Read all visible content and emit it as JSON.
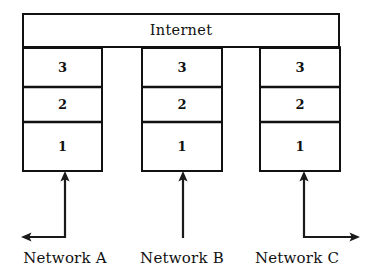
{
  "figure": {
    "type": "diagram",
    "background_color": "#ffffff",
    "line_color": "#111111"
  },
  "internet": {
    "label": "Internet",
    "box": {
      "x": 22,
      "y": 13,
      "width": 318,
      "height": 34
    }
  },
  "layers": [
    {
      "label": "3",
      "y": 47,
      "height": 40
    },
    {
      "label": "2",
      "y": 87,
      "height": 35
    },
    {
      "label": "1",
      "y": 122,
      "height": 50
    }
  ],
  "stacks": [
    {
      "id": "stack-a",
      "network_label": "Network A",
      "x": 22,
      "width": 81,
      "layer_labels": [
        "3",
        "2",
        "1"
      ],
      "connector": {
        "kind": "elbow-left",
        "vertical_x": 65,
        "vertical_top": 172,
        "vertical_bottom": 237,
        "horizontal_y": 237,
        "horizontal_end_x": 22,
        "arrow_up": true,
        "arrow_side": "left"
      },
      "label_center_x": 65,
      "label_y": 251
    },
    {
      "id": "stack-b",
      "network_label": "Network B",
      "x": 141,
      "width": 82,
      "layer_labels": [
        "3",
        "2",
        "1"
      ],
      "connector": {
        "kind": "straight",
        "vertical_x": 183,
        "vertical_top": 172,
        "vertical_bottom": 238,
        "arrow_up": true,
        "arrow_side": "none"
      },
      "label_center_x": 182,
      "label_y": 251
    },
    {
      "id": "stack-c",
      "network_label": "Network C",
      "x": 259,
      "width": 82,
      "layer_labels": [
        "3",
        "2",
        "1"
      ],
      "connector": {
        "kind": "elbow-right",
        "vertical_x": 304,
        "vertical_top": 172,
        "vertical_bottom": 237,
        "horizontal_y": 237,
        "horizontal_end_x": 359,
        "arrow_up": true,
        "arrow_side": "right"
      },
      "label_center_x": 297,
      "label_y": 251
    }
  ]
}
